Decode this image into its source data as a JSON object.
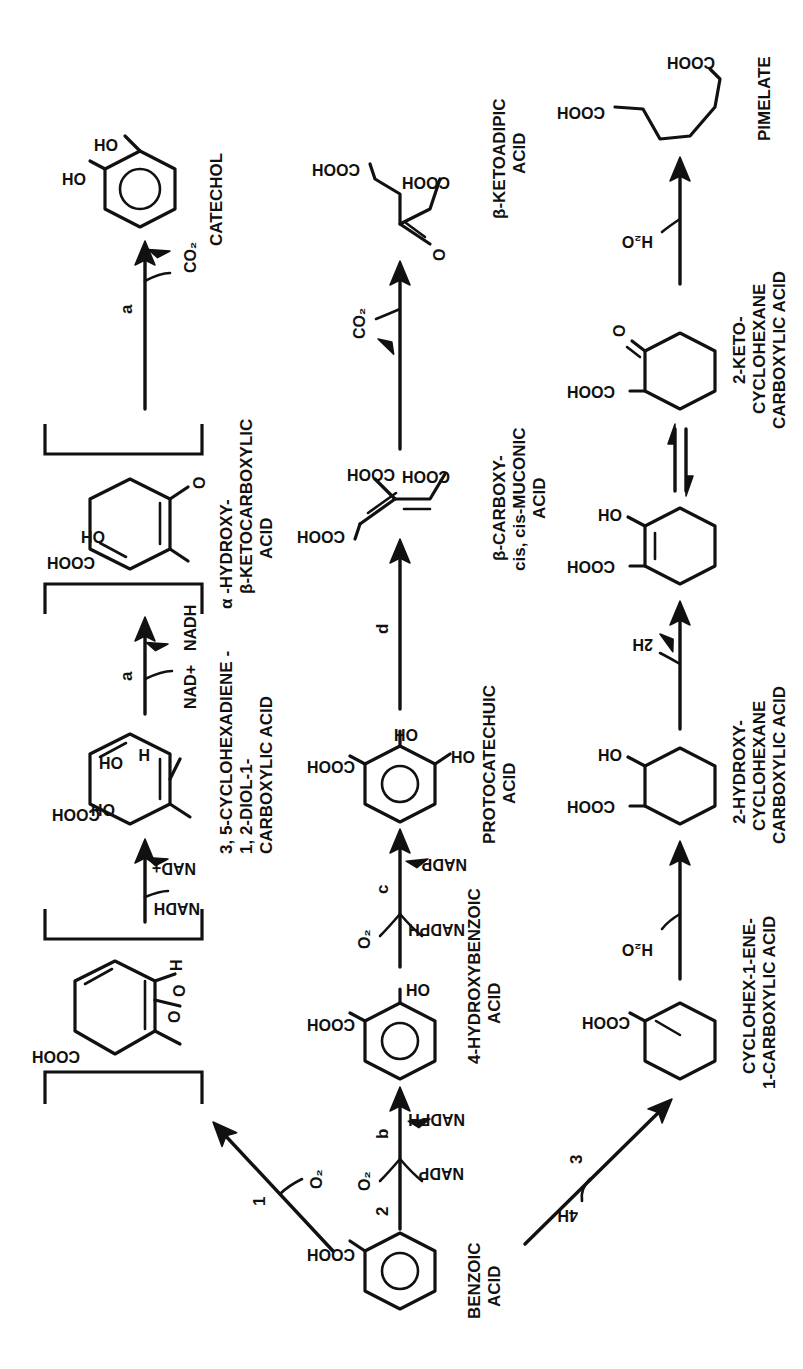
{
  "figure": {
    "orientation": "rotated-90-ccw",
    "rows": [
      {
        "id": "row-1",
        "compounds": [
          {
            "id": "dioxetane-intermediate",
            "label": "",
            "bracketed": true,
            "substituents": [
              "COOH",
              "O",
              "O",
              "H"
            ]
          },
          {
            "id": "diol",
            "label_lines": [
              "3, 5-CYCLOHEXADIENE -",
              "1, 2-DIOL-1-",
              "CARBOXYLIC ACID"
            ],
            "substituents": [
              "COOH",
              "OH",
              "OH",
              "H"
            ]
          },
          {
            "id": "hydroxy-ketoacid",
            "bracketed": true,
            "label_lines": [
              "α -HYDROXY-",
              "β-KETOCARBOXYLIC",
              "ACID"
            ],
            "substituents": [
              "COOH",
              "OH",
              "O"
            ]
          },
          {
            "id": "catechol",
            "label_lines": [
              "CATECHOL"
            ],
            "substituents": [
              "OH",
              "OH"
            ]
          }
        ],
        "steps": [
          {
            "enzyme": "1",
            "inputs": [
              "O₂"
            ],
            "outputs": []
          },
          {
            "enzyme": "",
            "inputs": [
              "NADH"
            ],
            "outputs": [
              "NAD+"
            ]
          },
          {
            "enzyme": "a",
            "inputs": [
              "NAD+"
            ],
            "outputs": [
              "NADH"
            ]
          },
          {
            "enzyme": "a",
            "inputs": [],
            "outputs": [
              "CO₂"
            ]
          }
        ]
      },
      {
        "id": "row-2",
        "compounds": [
          {
            "id": "benzoic-acid",
            "label_lines": [
              "BENZOIC",
              "ACID"
            ],
            "substituents": [
              "COOH"
            ]
          },
          {
            "id": "4-hydroxybenzoic-acid",
            "label_lines": [
              "4-HYDROXYBENZOIC",
              "ACID"
            ],
            "substituents": [
              "COOH",
              "OH"
            ]
          },
          {
            "id": "protocatechuic-acid",
            "label_lines": [
              "PROTOCATECHUIC",
              "ACID"
            ],
            "substituents": [
              "COOH",
              "OH",
              "OH"
            ]
          },
          {
            "id": "carboxy-muconic-acid",
            "label_lines": [
              "β-CARBOXY-",
              "cis, cis-MUCONIC",
              "ACID"
            ],
            "substituents": [
              "COOH",
              "COOH",
              "COOH"
            ]
          },
          {
            "id": "ketoadipic-acid",
            "label_lines": [
              "β-KETOADIPIC",
              "ACID"
            ],
            "substituents": [
              "O",
              "COOH",
              "COOH"
            ]
          }
        ],
        "steps": [
          {
            "enzyme": "2",
            "inputs": [
              "O₂",
              "NADPH"
            ],
            "outputs": [
              "NADP"
            ],
            "enzyme_letter": "b"
          },
          {
            "enzyme": "c",
            "inputs": [
              "O₂",
              "NADPH"
            ],
            "outputs": [
              "NADP"
            ]
          },
          {
            "enzyme": "d",
            "inputs": [],
            "outputs": []
          },
          {
            "enzyme": "",
            "inputs": [],
            "outputs": [
              "CO₂"
            ]
          }
        ]
      },
      {
        "id": "row-3",
        "compounds": [
          {
            "id": "cyclohexene-carboxylic-acid",
            "label_lines": [
              "CYCLOHEX-1-ENE-",
              "1-CARBOXYLIC ACID"
            ],
            "substituents": [
              "COOH"
            ]
          },
          {
            "id": "hydroxy-cyclohexane-carboxylic-acid",
            "label_lines": [
              "2-HYDROXY-",
              "CYCLOHEXANE",
              "CARBOXYLIC ACID"
            ],
            "substituents": [
              "COOH",
              "OH"
            ]
          },
          {
            "id": "enol-intermediate",
            "label_lines": [],
            "substituents": [
              "COOH",
              "OH"
            ]
          },
          {
            "id": "keto-cyclohexane-carboxylic-acid",
            "label_lines": [
              "2-KETO-",
              "CYCLOHEXANE",
              "CARBOXYLIC ACID"
            ],
            "substituents": [
              "COOH",
              "O"
            ]
          },
          {
            "id": "pimelate",
            "label_lines": [
              "PIMELATE"
            ],
            "substituents": [
              "COOH",
              "COOH"
            ]
          }
        ],
        "steps": [
          {
            "enzyme": "3",
            "inputs": [
              "4H"
            ],
            "outputs": []
          },
          {
            "enzyme": "",
            "inputs": [
              "H₂O"
            ],
            "outputs": []
          },
          {
            "enzyme": "",
            "inputs": [],
            "outputs": [
              "2H"
            ]
          },
          {
            "enzyme": "",
            "type": "equilibrium"
          },
          {
            "enzyme": "",
            "inputs": [
              "H₂O"
            ],
            "outputs": []
          }
        ]
      }
    ]
  },
  "text": {
    "cooh": "COOH",
    "oh": "OH",
    "o": "O",
    "h": "H",
    "o2": "O₂",
    "co2": "CO₂",
    "h2o": "H₂O",
    "nadh": "NADH",
    "nadplus": "NAD+",
    "nadp": "NADP",
    "nadph": "NADPH",
    "h4": "4H",
    "h2": "2H",
    "step1": "1",
    "step2": "2",
    "step3": "3",
    "stepA": "a",
    "stepB": "b",
    "stepC": "c",
    "stepD": "d",
    "benzoic": [
      "BENZOIC",
      "ACID"
    ],
    "diol": [
      "3, 5-CYCLOHEXADIENE -",
      "1, 2-DIOL-1-",
      "CARBOXYLIC ACID"
    ],
    "hydroxyketo": [
      "α -HYDROXY-",
      "β-KETOCARBOXYLIC",
      "ACID"
    ],
    "catechol": "CATECHOL",
    "hba": [
      "4-HYDROXYBENZOIC",
      "ACID"
    ],
    "proto": [
      "PROTOCATECHUIC",
      "ACID"
    ],
    "muconic": [
      "β-CARBOXY-",
      "cis, cis-MUCONIC",
      "ACID"
    ],
    "ketoadipic": [
      "β-KETOADIPIC",
      "ACID"
    ],
    "chene": [
      "CYCLOHEX-1-ENE-",
      "1-CARBOXYLIC ACID"
    ],
    "hydroxycyc": [
      "2-HYDROXY-",
      "CYCLOHEXANE",
      "CARBOXYLIC ACID"
    ],
    "ketocyc": [
      "2-KETO-",
      "CYCLOHEXANE",
      "CARBOXYLIC ACID"
    ],
    "pimelate": "PIMELATE"
  }
}
